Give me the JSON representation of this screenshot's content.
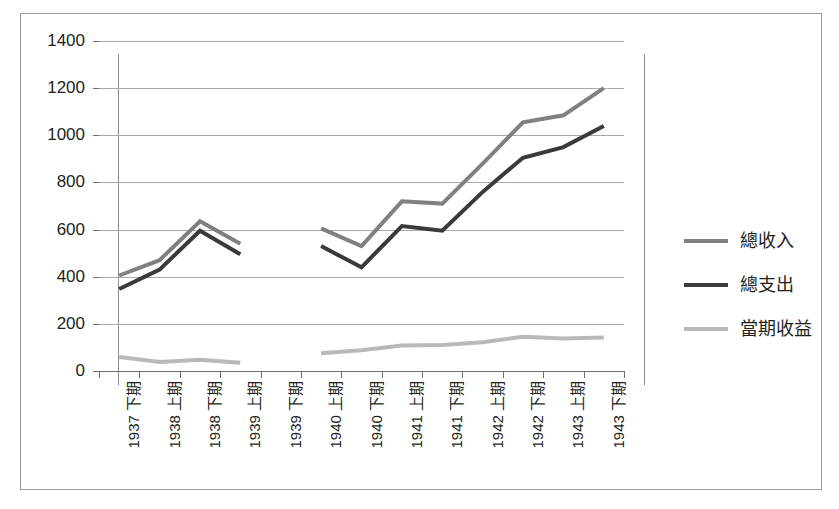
{
  "chart_data": {
    "type": "line",
    "title": "",
    "subtitle": "",
    "xlabel": "",
    "ylabel": "",
    "ylim": [
      0,
      1400
    ],
    "ytick_step": 200,
    "yticks": [
      "0",
      "200",
      "400",
      "600",
      "800",
      "1000",
      "1200",
      "1400"
    ],
    "grid": true,
    "legend_position": "right",
    "categories": [
      "1937 下期",
      "1938 上期",
      "1938 下期",
      "1939 上期",
      "1939 下期",
      "1940 上期",
      "1940 下期",
      "1941 上期",
      "1941 下期",
      "1942 上期",
      "1942 下期",
      "1943 上期",
      "1943 下期"
    ],
    "series": [
      {
        "name": "總收入",
        "color": "#808080",
        "width": 4,
        "values": [
          405,
          470,
          635,
          540,
          null,
          605,
          530,
          720,
          710,
          880,
          1055,
          1085,
          1200
        ]
      },
      {
        "name": "總支出",
        "color": "#3a3a3a",
        "width": 4,
        "values": [
          348,
          430,
          595,
          495,
          null,
          530,
          440,
          615,
          595,
          760,
          905,
          950,
          1040
        ]
      },
      {
        "name": "當期收益",
        "color": "#b9b9b9",
        "width": 4,
        "values": [
          60,
          38,
          48,
          35,
          null,
          75,
          88,
          108,
          110,
          122,
          145,
          138,
          142
        ]
      }
    ]
  },
  "legend": {
    "items": [
      {
        "label": "總收入",
        "color": "#808080"
      },
      {
        "label": "總支出",
        "color": "#3a3a3a"
      },
      {
        "label": "當期收益",
        "color": "#b9b9b9"
      }
    ]
  }
}
